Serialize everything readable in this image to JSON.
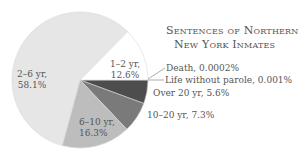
{
  "chart_data": {
    "type": "pie",
    "title": "Sentences of Northern New York Inmates",
    "title_lines": [
      "Sentences of Northern",
      "New York Inmates"
    ],
    "slices": [
      {
        "label": "Death",
        "value": 0.0002,
        "display": "Death, 0.0002%",
        "color": "#ffffff"
      },
      {
        "label": "Life without parole",
        "value": 0.001,
        "display": "Life without parole, 0.001%",
        "color": "#ffffff"
      },
      {
        "label": "Over 20 yr",
        "value": 5.6,
        "display": "Over 20 yr, 5.6%",
        "color": "#4d4d4d"
      },
      {
        "label": "10–20 yr",
        "value": 7.3,
        "display": "10–20 yr, 7.3%",
        "color": "#7a7a7a"
      },
      {
        "label": "6–10 yr",
        "value": 16.3,
        "display_lines": [
          "6–10 yr,",
          "16.3%"
        ],
        "color": "#bdbdbd"
      },
      {
        "label": "2–6 yr",
        "value": 58.1,
        "display_lines": [
          "2–6 yr,",
          "58.1%"
        ],
        "color": "#e6e6e6"
      },
      {
        "label": "1–2 yr",
        "value": 12.6,
        "display_lines": [
          "1–2 yr,",
          "12.6%"
        ],
        "color": "#ffffff"
      }
    ],
    "start_angle_deg": 0,
    "direction": "clockwise",
    "legend": "none (direct labels)",
    "units": "%"
  }
}
